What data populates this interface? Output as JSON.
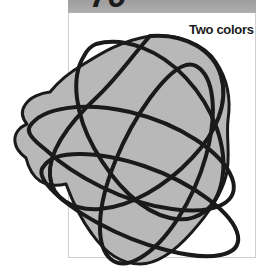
{
  "page": {
    "width": 267,
    "height": 269,
    "background_color": "#ffffff"
  },
  "banner": {
    "page_number": "76",
    "background_color": "#a6a6a6",
    "text_color": "#1c1c1c"
  },
  "panel": {
    "background_color": "#ffffff",
    "border_color": "#cfcfcf"
  },
  "caption": {
    "text": "Two colors",
    "color": "#1a1a1a"
  },
  "artwork": {
    "name": "overlapping-loops-drawing",
    "fill_color": "#b8b8b8",
    "stroke_color": "#1a1a1a",
    "stroke_width": 4,
    "blob_outline_width": 3,
    "description": "Gray amoeba-shaped fill overlaid with several large elongated loop curves crossing each other",
    "blob_path": "M 150 36 C 178 33 205 45 216 62 C 228 80 231 100 228 120 C 226 140 231 158 226 176 C 221 196 208 214 192 232 C 176 250 158 264 140 264 C 120 264 104 251 92 234 C 80 218 72 200 66 184 C 58 186 48 186 40 181 C 31 175 28 166 26 158 C 22 155 16 150 15 142 C 14 133 20 127 27 124 C 22 118 21 111 25 105 C 30 97 41 93 50 92 C 58 82 70 72 84 64 C 100 54 120 41 150 36 Z",
    "loops": [
      {
        "name": "loop-1",
        "path": "M 150 36 C 186 33 214 51 221 76 C 229 103 216 133 192 158 C 166 186 130 207 100 209 C 72 211 52 198 50 176 C 48 152 68 124 98 96 C 118 77 132 56 150 36 Z"
      },
      {
        "name": "loop-2",
        "path": "M 96 44 C 124 36 160 50 186 78 C 214 108 228 148 222 180 C 217 209 196 224 170 218 C 142 212 114 184 94 148 C 76 116 70 78 84 56 C 87 50 91 46 96 44 Z"
      },
      {
        "name": "loop-3",
        "path": "M 30 126 C 42 108 82 101 130 112 C 180 124 222 152 232 178 C 241 202 216 215 172 209 C 124 203 74 176 46 150 C 32 139 26 132 30 126 Z"
      },
      {
        "name": "loop-4",
        "path": "M 44 166 C 54 150 96 150 144 166 C 194 183 234 214 238 236 C 241 256 212 262 166 250 C 118 238 70 210 50 188 C 40 177 40 170 44 166 Z"
      },
      {
        "name": "loop-5",
        "path": "M 196 66 C 214 76 218 112 206 156 C 193 202 166 243 140 258 C 116 272 99 258 100 224 C 101 186 124 134 150 98 C 170 71 185 60 196 66 Z"
      }
    ]
  }
}
